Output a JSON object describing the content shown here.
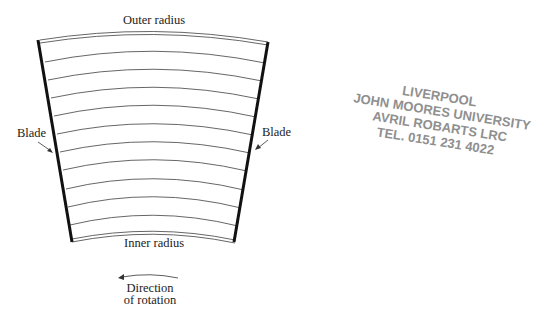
{
  "diagram": {
    "labels": {
      "outer_radius": "Outer radius",
      "inner_radius": "Inner radius",
      "blade_left": "Blade",
      "blade_right": "Blade",
      "direction_line1": "Direction",
      "direction_line2": "of rotation"
    },
    "arc_count": 12,
    "colors": {
      "blade": "#111111",
      "arc": "#555555",
      "text": "#222222",
      "stamp": "#6a6a6a"
    }
  },
  "stamp": {
    "line1": "LIVERPOOL",
    "line2": "JOHN MOORES UNIVERSITY",
    "line3": "AVRIL ROBARTS LRC",
    "line4": "TEL. 0151 231 4022"
  }
}
